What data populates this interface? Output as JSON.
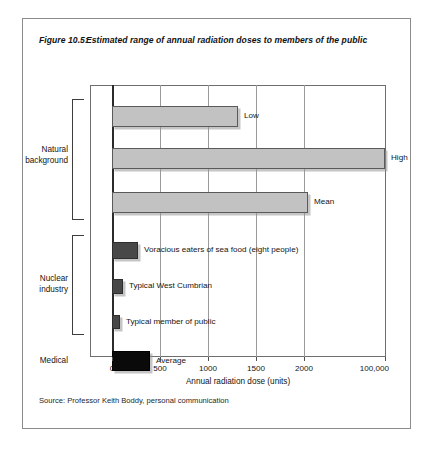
{
  "figure": {
    "number": "Figure 10.5:",
    "title": "Estimated range of annual radiation doses to members of the public",
    "source": "Source: Professor Keith Boddy, personal communication"
  },
  "chart_data": {
    "type": "bar",
    "orientation": "horizontal",
    "title": "Estimated range of annual radiation doses to members of the public",
    "xlabel": "Annual radiation dose (units)",
    "ylabel": "",
    "grid": true,
    "legend": false,
    "axis_break": true,
    "xticks": [
      "0",
      "500",
      "1000",
      "1500",
      "2000",
      "100,000"
    ],
    "xtick_values": [
      0,
      500,
      1000,
      1500,
      2000,
      100000
    ],
    "xlim": [
      0,
      100000
    ],
    "groups": [
      {
        "label_line1": "Natural",
        "label_line2": "background"
      },
      {
        "label_line1": "Nuclear",
        "label_line2": "industry"
      },
      {
        "label_line1": "Medical",
        "label_line2": ""
      }
    ],
    "categories": [
      "Low",
      "High",
      "Mean",
      "Voracious eaters of sea food (eight people)",
      "Typical West Cumbrian",
      "Typical member of public",
      "Average"
    ],
    "values": [
      1300,
      2850,
      2050,
      250,
      90,
      55,
      400
    ],
    "series": [
      {
        "name": "Annual radiation dose (units)",
        "values": [
          1300,
          2850,
          2050,
          250,
          90,
          55,
          400
        ]
      }
    ],
    "bars": [
      {
        "label": "Low",
        "group": "Natural background",
        "value": 1300,
        "shade": "light"
      },
      {
        "label": "High",
        "group": "Natural background",
        "value": 2850,
        "shade": "light"
      },
      {
        "label": "Mean",
        "group": "Natural background",
        "value": 2050,
        "shade": "light"
      },
      {
        "label": "Voracious eaters of sea food (eight people)",
        "group": "Nuclear industry",
        "value": 250,
        "shade": "dark"
      },
      {
        "label": "Typical West Cumbrian",
        "group": "Nuclear industry",
        "value": 90,
        "shade": "dark"
      },
      {
        "label": "Typical member of public",
        "group": "Nuclear industry",
        "value": 55,
        "shade": "dark"
      },
      {
        "label": "Average",
        "group": "Medical",
        "value": 400,
        "shade": "black"
      }
    ],
    "colors": {
      "light_bar": "#c2c2c2",
      "dark_bar": "#484848",
      "black_bar": "#0a0a0a",
      "gridline": "#9a9a9a",
      "frame": "#6e6e6e",
      "background": "#ffffff"
    }
  }
}
